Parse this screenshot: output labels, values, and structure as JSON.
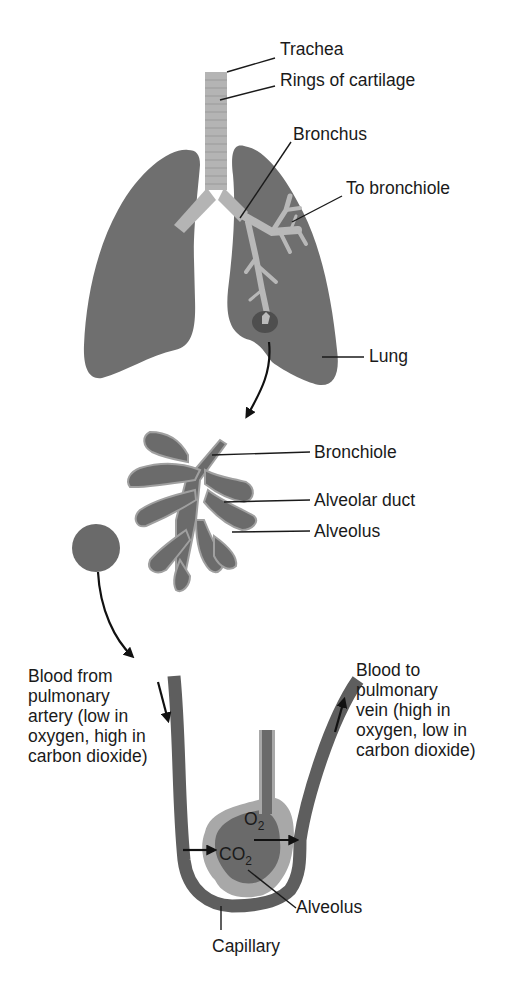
{
  "colors": {
    "lung": "#6f6f6f",
    "lung_dark": "#5a5a5a",
    "airway": "#b4b4b4",
    "capillary": "#5e5e5e",
    "alveolus_inner": "#6a6a6a",
    "alveolus_outer": "#a8a8a8",
    "text": "#1a1a1a"
  },
  "labels": {
    "trachea": "Trachea",
    "rings_of_cartilage": "Rings of cartilage",
    "bronchus": "Bronchus",
    "to_bronchiole": "To bronchiole",
    "lung": "Lung",
    "bronchiole": "Bronchiole",
    "alveolar_duct": "Alveolar duct",
    "alveolus_top": "Alveolus",
    "alveolus_bottom": "Alveolus",
    "capillary": "Capillary"
  },
  "blood_from": {
    "lines": [
      "Blood from",
      "pulmonary",
      "artery (low in",
      "oxygen, high in",
      "carbon dioxide)"
    ]
  },
  "blood_to": {
    "lines": [
      "Blood to",
      "pulmonary",
      "vein (high in",
      "oxygen, low in",
      "carbon dioxide)"
    ]
  },
  "gases": {
    "o2": {
      "symbol": "O",
      "subscript": "2"
    },
    "co2": {
      "symbol": "CO",
      "subscript": "2"
    }
  }
}
